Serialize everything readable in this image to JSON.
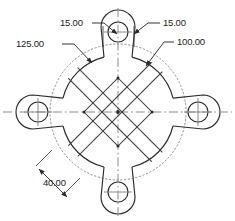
{
  "drawing": {
    "title": "four-lobe-flange-plate-dimensioned-drawing",
    "background_color": "#ffffff",
    "line_color": "#2b2b2b",
    "hidden_line_color": "#8a8a8a",
    "center_line_color": "#808080",
    "text_color": "#1a1a1a",
    "units": "mm",
    "decimals": 2
  },
  "geometry": {
    "center": {
      "x": 118,
      "y": 112
    },
    "main_circle_diameter": 100.0,
    "bolt_circle_diameter": 125.0,
    "bolt_circle_style": "dotted",
    "main_circle_radius_px": 56,
    "bolt_circle_radius_px": 68,
    "lobe_count": 4,
    "lobe_angles_deg": [
      90,
      0,
      270,
      180
    ],
    "bolt_hole_diameter": 15.0,
    "bolt_hole_radius_px": 10,
    "lobe_outer_radius_px": 17,
    "inner_diamond_half_diagonal_px": 34,
    "diagonal_offset_px": 13
  },
  "dimensions": [
    {
      "id": "dim-bolt-circle",
      "label": "125.00",
      "value": 125.0,
      "kind": "leader",
      "target": "bolt-circle",
      "text_x": 16,
      "text_y": 47
    },
    {
      "id": "dim-hole-left",
      "label": "15.00",
      "value": 15.0,
      "kind": "leader",
      "target": "top-lobe-hole-left",
      "text_x": 60,
      "text_y": 26
    },
    {
      "id": "dim-hole-right",
      "label": "15.00",
      "value": 15.0,
      "kind": "leader",
      "target": "top-lobe-hole-right",
      "text_x": 163,
      "text_y": 26
    },
    {
      "id": "dim-main-circle",
      "label": "100.00",
      "value": 100.0,
      "kind": "leader",
      "target": "main-circle",
      "text_x": 177,
      "text_y": 45
    },
    {
      "id": "dim-diagonal-offset",
      "label": "40.00",
      "value": 40.0,
      "kind": "linear-diagonal",
      "target": "diagonal-rib-spacing",
      "text_x": 43,
      "text_y": 186
    }
  ],
  "labels": {
    "bolt_circle": "125.00",
    "hole_left": "15.00",
    "hole_right": "15.00",
    "main_circle": "100.00",
    "diagonal_offset": "40.00"
  }
}
